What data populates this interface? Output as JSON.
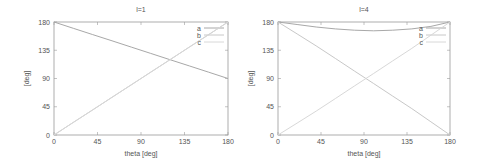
{
  "chart_data": [
    {
      "type": "line",
      "title": "l=1",
      "xlabel": "theta [deg]",
      "ylabel": "[deg]",
      "xlim": [
        0,
        180
      ],
      "ylim": [
        0,
        180
      ],
      "xticks": [
        0,
        45,
        90,
        135,
        180
      ],
      "yticks": [
        0,
        45,
        90,
        135,
        180
      ],
      "legend_position": "top-right",
      "x": [
        0,
        20,
        40,
        60,
        80,
        100,
        120,
        140,
        160,
        180
      ],
      "series": [
        {
          "name": "a",
          "color": "#a8a8a8",
          "values": [
            180,
            170,
            160,
            150,
            140,
            130,
            120,
            110,
            100,
            90
          ]
        },
        {
          "name": "b",
          "color": "#c8c8c8",
          "values": [
            0,
            20,
            40,
            60,
            80,
            100,
            120,
            140,
            160,
            180
          ]
        },
        {
          "name": "c",
          "color": "#d8d8d8",
          "values": [
            0,
            20,
            40,
            60,
            80,
            100,
            120,
            140,
            160,
            180
          ]
        }
      ]
    },
    {
      "type": "line",
      "title": "l=4",
      "xlabel": "theta [deg]",
      "ylabel": "[deg]",
      "xlim": [
        0,
        180
      ],
      "ylim": [
        0,
        180
      ],
      "xticks": [
        0,
        45,
        90,
        135,
        180
      ],
      "yticks": [
        0,
        45,
        90,
        135,
        180
      ],
      "legend_position": "top-right",
      "x": [
        0,
        20,
        40,
        60,
        80,
        100,
        120,
        140,
        160,
        180
      ],
      "series": [
        {
          "name": "a",
          "color": "#a8a8a8",
          "values": [
            180,
            176,
            172,
            169,
            167,
            166,
            167,
            169,
            173,
            180
          ]
        },
        {
          "name": "b",
          "color": "#c8c8c8",
          "values": [
            180,
            161,
            142,
            122,
            102,
            82,
            62,
            42,
            21,
            0
          ]
        },
        {
          "name": "c",
          "color": "#d8d8d8",
          "values": [
            0,
            19,
            38,
            58,
            78,
            98,
            118,
            138,
            159,
            180
          ]
        }
      ]
    }
  ]
}
